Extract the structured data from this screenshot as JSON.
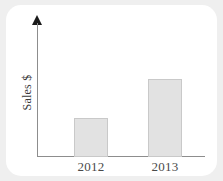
{
  "chart_data": {
    "type": "bar",
    "title": "",
    "subtitle": "",
    "xlabel": "",
    "ylabel": "Sales $",
    "categories": [
      "2012",
      "2013"
    ],
    "values": [
      1,
      2
    ],
    "value_unit": "relative bar height (unlabeled axis)",
    "ylim": [
      0,
      2.2
    ],
    "grid": false,
    "legend": false,
    "legend_position": "none",
    "axis_arrow": true,
    "annotations": [],
    "bar_color": "#e2e2e2",
    "bar_border_color": "#c9c9c9",
    "axis_color": "#8d8d8d",
    "arrow_color": "#1a1a1a"
  },
  "card": {
    "background": "#ffffff",
    "page_background": "#efefef"
  },
  "axes": {
    "y_title": "Sales $",
    "x_tick_labels": [
      "2012",
      "2013"
    ]
  }
}
